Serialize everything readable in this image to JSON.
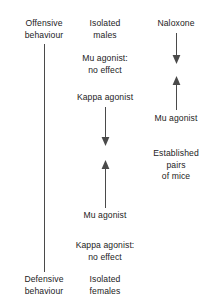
{
  "figure": {
    "type": "flow-diagram",
    "background_color": "#ffffff",
    "line_color": "#4a4a4a",
    "text_color": "#232323"
  },
  "columns": {
    "left": {
      "name": "behaviour-axis",
      "top_label": "Offensive\nbehaviour",
      "bottom_label": "Defensive\nbehaviour",
      "connector": "plain-vertical-line"
    },
    "middle": {
      "name": "isolated-mice-column",
      "top_label": "Isolated\nmales",
      "note_top": "Mu agonist:\nno effect",
      "treatment_down": "Kappa agonist",
      "treatment_up": "Mu agonist",
      "note_bottom": "Kappa agonist:\nno effect",
      "bottom_label": "Isolated\nfemales"
    },
    "right": {
      "name": "established-pairs-column",
      "top_label": "Naloxone",
      "treatment_up": "Mu agonist",
      "group_label": "Established\npairs\nof mice"
    }
  },
  "arrows": [
    {
      "id": "mid-down-arrow",
      "column": "middle",
      "direction": "down",
      "from": "Kappa agonist",
      "toward": "Defensive behaviour"
    },
    {
      "id": "mid-up-arrow",
      "column": "middle",
      "direction": "up",
      "from": "Mu agonist",
      "toward": "Offensive behaviour"
    },
    {
      "id": "right-down-arrow",
      "column": "right",
      "direction": "down",
      "from": "Naloxone",
      "toward": "Defensive behaviour"
    },
    {
      "id": "right-up-arrow",
      "column": "right",
      "direction": "up",
      "from": "Mu agonist",
      "toward": "Offensive behaviour"
    }
  ]
}
